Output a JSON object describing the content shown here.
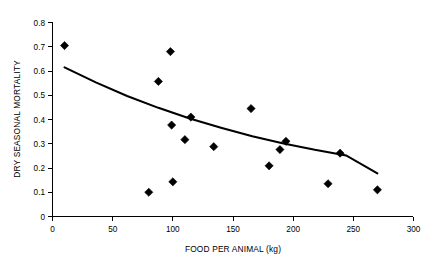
{
  "chart_data": {
    "type": "scatter",
    "title": "",
    "xlabel": "FOOD PER ANIMAL (kg)",
    "ylabel": "DRY SEASONAL MORTALITY",
    "xlim": [
      0,
      300
    ],
    "ylim": [
      0,
      0.8
    ],
    "grid": false,
    "legend": "none",
    "x_ticks": [
      "0",
      "50",
      "100",
      "150",
      "200",
      "250",
      "300"
    ],
    "x_tick_values": [
      0,
      50,
      100,
      150,
      200,
      250,
      300
    ],
    "y_ticks": [
      "0",
      "0.1",
      "0.2",
      "0.3",
      "0.4",
      "0.5",
      "0.6",
      "0.7",
      "0.8"
    ],
    "y_tick_values": [
      0,
      0.1,
      0.2,
      0.3,
      0.4,
      0.5,
      0.6,
      0.7,
      0.8
    ],
    "series": [
      {
        "name": "observations",
        "marker": "diamond",
        "color": "#000000",
        "points": [
          {
            "x": 10,
            "y": 0.705
          },
          {
            "x": 80,
            "y": 0.1
          },
          {
            "x": 88,
            "y": 0.557
          },
          {
            "x": 98,
            "y": 0.68
          },
          {
            "x": 99,
            "y": 0.377
          },
          {
            "x": 100,
            "y": 0.143
          },
          {
            "x": 110,
            "y": 0.317
          },
          {
            "x": 115,
            "y": 0.41
          },
          {
            "x": 134,
            "y": 0.288
          },
          {
            "x": 165,
            "y": 0.445
          },
          {
            "x": 180,
            "y": 0.209
          },
          {
            "x": 189,
            "y": 0.276
          },
          {
            "x": 194,
            "y": 0.31
          },
          {
            "x": 229,
            "y": 0.135
          },
          {
            "x": 239,
            "y": 0.261
          },
          {
            "x": 270,
            "y": 0.11
          }
        ]
      }
    ],
    "trendline": {
      "name": "fitted-decay-curve",
      "color": "#000000",
      "x_start": 10,
      "x_end": 270,
      "points": [
        {
          "x": 10,
          "y": 0.615
        },
        {
          "x": 36,
          "y": 0.553
        },
        {
          "x": 62,
          "y": 0.497
        },
        {
          "x": 88,
          "y": 0.448
        },
        {
          "x": 114,
          "y": 0.404
        },
        {
          "x": 140,
          "y": 0.366
        },
        {
          "x": 166,
          "y": 0.331
        },
        {
          "x": 192,
          "y": 0.301
        },
        {
          "x": 218,
          "y": 0.275
        },
        {
          "x": 244,
          "y": 0.252
        },
        {
          "x": 270,
          "y": 0.178
        }
      ]
    }
  }
}
